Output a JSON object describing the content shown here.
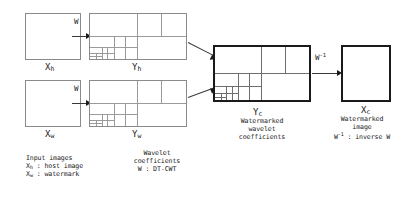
{
  "diagram": {
    "boxes": {
      "x_host": {
        "label": "X",
        "sub": "h"
      },
      "x_watermark": {
        "label": "X",
        "sub": "w"
      },
      "y_host": {
        "label": "Y",
        "sub": "h"
      },
      "y_watermark": {
        "label": "Y",
        "sub": "w"
      },
      "y_combined": {
        "label": "Y",
        "sub": "c"
      },
      "x_combined": {
        "label": "X",
        "sub": "c"
      }
    },
    "arrows": {
      "w_top": "W",
      "w_bottom": "W",
      "w_inverse": "W",
      "w_inverse_sup": "-1"
    },
    "captions": {
      "input": {
        "line1": "Input images",
        "line2_sym": "X",
        "line2_sub": "h",
        "line2_text": ": host image",
        "line3_sym": "X",
        "line3_sub": "w",
        "line3_text": ": watermark"
      },
      "wavelet": {
        "line1": "Wavelet",
        "line2": "coefficients",
        "line3": "W : DT-CWT"
      },
      "combined": {
        "line1": "Watermarked",
        "line2": "wavelet",
        "line3": "coefficients"
      },
      "output": {
        "line1": "Watermarked",
        "line2": "image",
        "line3_sym": "W",
        "line3_sup": "-1",
        "line3_text": ": inverse W"
      }
    },
    "colors": {
      "background": "#ffffff",
      "thin_stroke": "#8a8a8a",
      "thick_stroke": "#1a1a1a",
      "subband_stroke": "#9a9a9a",
      "text": "#1c1c1c"
    }
  }
}
